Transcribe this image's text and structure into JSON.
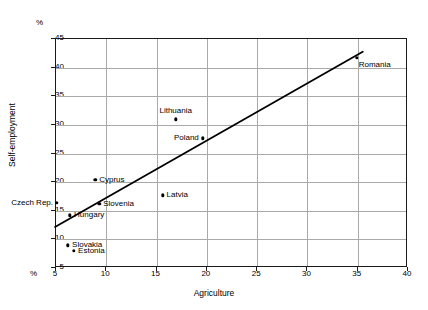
{
  "chart_data": {
    "type": "scatter",
    "title": "",
    "xlabel": "Agriculture",
    "ylabel": "Self-employment",
    "x_unit": "%",
    "y_unit": "%",
    "xlim": [
      5,
      40
    ],
    "ylim": [
      5,
      45
    ],
    "xticks": [
      5,
      10,
      15,
      20,
      25,
      30,
      35,
      40
    ],
    "yticks": [
      5,
      10,
      15,
      20,
      25,
      30,
      35,
      40,
      45
    ],
    "grid": true,
    "legend": "none",
    "points": [
      {
        "label": "Czech Rep.",
        "x": 5.2,
        "y": 16.2,
        "label_pos": "left"
      },
      {
        "label": "Hungary",
        "x": 6.5,
        "y": 14.0,
        "label_pos": "right"
      },
      {
        "label": "Slovakia",
        "x": 6.3,
        "y": 8.8,
        "label_pos": "right"
      },
      {
        "label": "Estonia",
        "x": 6.9,
        "y": 7.8,
        "label_pos": "right"
      },
      {
        "label": "Cyprus",
        "x": 9.0,
        "y": 20.2,
        "label_pos": "right"
      },
      {
        "label": "Slovenia",
        "x": 9.4,
        "y": 16.0,
        "label_pos": "right"
      },
      {
        "label": "Latvia",
        "x": 15.7,
        "y": 17.5,
        "label_pos": "right"
      },
      {
        "label": "Lithuania",
        "x": 17.0,
        "y": 30.8,
        "label_pos": "top"
      },
      {
        "label": "Poland",
        "x": 19.7,
        "y": 27.5,
        "label_pos": "left"
      },
      {
        "label": "Romania",
        "x": 35.0,
        "y": 41.5,
        "label_pos": "rightbelow"
      }
    ],
    "trendline": {
      "x0": 5.0,
      "y0": 12.0,
      "x1": 35.6,
      "y1": 42.6
    }
  },
  "colors": {
    "frame": "#1a1a1a",
    "grid": "#a9a9a9",
    "marker": "#000000",
    "trendline": "#000000",
    "background": "#ffffff"
  }
}
